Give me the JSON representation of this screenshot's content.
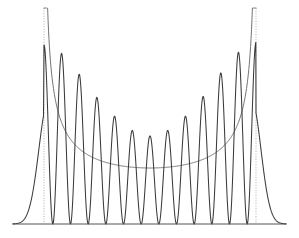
{
  "figure": {
    "title": "",
    "background_color": "#ffffff",
    "width": 299,
    "height": 238
  },
  "chart_data": {
    "type": "line",
    "title": "",
    "subtitle": "",
    "xlabel": "",
    "ylabel": "",
    "grid": false,
    "legend_position": "none",
    "axis": {
      "x_start_px": 13,
      "x_end_px": 286,
      "baseline_y_px": 224,
      "show_x_axis": true,
      "show_y_axis": false,
      "xlim": [
        -1.45,
        1.45
      ],
      "ylim": [
        0,
        1.0
      ]
    },
    "series": [
      {
        "name": "quantum-probability-density",
        "role": "oscillating",
        "color": "#3a3a3a",
        "line_style": "solid",
        "line_width": 1.05,
        "quantum_number": 11,
        "n_peaks": 12,
        "peaks": [
          {
            "x_px": 54,
            "y_px": 45,
            "height": 0.812
          },
          {
            "x_px": 74,
            "y_px": 67,
            "height": 0.699
          },
          {
            "x_px": 93,
            "y_px": 93,
            "height": 0.564
          },
          {
            "x_px": 112,
            "y_px": 114,
            "height": 0.455
          },
          {
            "x_px": 131,
            "y_px": 130,
            "height": 0.374
          },
          {
            "x_px": 150,
            "y_px": 136,
            "height": 0.343
          },
          {
            "x_px": 169,
            "y_px": 130,
            "height": 0.374
          },
          {
            "x_px": 188,
            "y_px": 114,
            "height": 0.455
          },
          {
            "x_px": 206,
            "y_px": 93,
            "height": 0.564
          },
          {
            "x_px": 225,
            "y_px": 67,
            "height": 0.699
          },
          {
            "x_px": 245,
            "y_px": 45,
            "height": 0.812
          },
          {
            "x_px": 264,
            "y_px": 40,
            "height": 0.838
          }
        ],
        "nodes_x_px": [
          44,
          64,
          84,
          103,
          122,
          141,
          160,
          179,
          197,
          216,
          235,
          255
        ],
        "tail_left_x_px": 13,
        "tail_right_x_px": 286
      },
      {
        "name": "classical-probability-density",
        "role": "envelope",
        "color": "#6b6b6b",
        "line_style": "solid",
        "line_width": 0.95,
        "minimum": {
          "x_px": 150,
          "y_px": 168,
          "value": 0.289
        },
        "samples_y_px": {
          "at_left_turning_point": 18,
          "at_quarter": 148,
          "at_center": 168,
          "at_right_turning_point": 18
        }
      }
    ],
    "annotations": [
      {
        "name": "left-turning-point",
        "type": "vertical-dotted-line",
        "x_px": 44,
        "y_top_px": 8,
        "y_bottom_px": 224,
        "color": "#a8a8a8"
      },
      {
        "name": "right-turning-point",
        "type": "vertical-dotted-line",
        "x_px": 256,
        "y_top_px": 8,
        "y_bottom_px": 224,
        "color": "#a8a8a8"
      }
    ]
  }
}
